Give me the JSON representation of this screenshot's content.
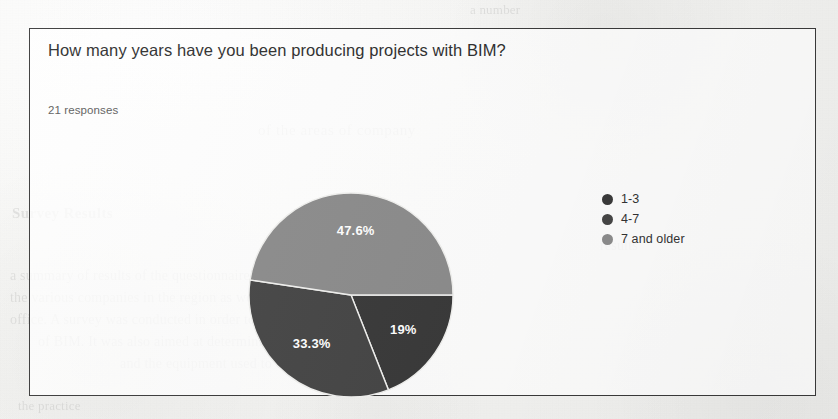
{
  "card": {
    "question_title": "How many years have you been producing projects with BIM?",
    "response_count": "21 responses"
  },
  "legend": {
    "items": [
      {
        "label": "1-3",
        "color": "#3a3a3a",
        "swatch_name": "legend-swatch-1-3"
      },
      {
        "label": "4-7",
        "color": "#464646",
        "swatch_name": "legend-swatch-4-7"
      },
      {
        "label": "7 and older",
        "color": "#8c8c8c",
        "swatch_name": "legend-swatch-7-and-older"
      }
    ]
  },
  "background_bleed": {
    "b1": "of the areas of company",
    "b2": "Survey Results",
    "b3": "a summary of results of the questionnaire that was sent to",
    "b4": "the various companies in the region as well as",
    "b5": "office. A survey was conducted in order to ascertain",
    "b6": "of BIM. It was also aimed at determining the structure of",
    "b7": "and the equipment used to carry it out",
    "b8": "the practice",
    "b9": "a number",
    "b10": "results"
  },
  "chart_data": {
    "type": "pie",
    "title": "How many years have you been producing projects with BIM?",
    "subtitle": "21 responses",
    "legend_position": "right",
    "labels_shown": true,
    "categories": [
      "1-3",
      "4-7",
      "7 and older"
    ],
    "values": [
      19.0,
      33.3,
      47.6
    ],
    "value_labels": [
      "19%",
      "33.3%",
      "47.6%"
    ],
    "colors": [
      "#3a3a3a",
      "#464646",
      "#8c8c8c"
    ],
    "start_angle_deg": 0,
    "direction": "clockwise",
    "units": "percent",
    "total_responses": 21
  }
}
